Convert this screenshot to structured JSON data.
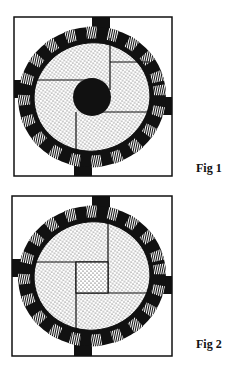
{
  "figures": [
    {
      "id": "fig1",
      "caption": "Fig 1",
      "frame": {
        "x": 14,
        "y": 17,
        "w": 158,
        "h": 159
      },
      "center": {
        "x": 92,
        "y": 97
      },
      "center_feature": "black-disc"
    },
    {
      "id": "fig2",
      "caption": "Fig 2",
      "frame": {
        "x": 12,
        "y": 196,
        "w": 160,
        "h": 160
      },
      "center": {
        "x": 92,
        "y": 276
      },
      "center_feature": "square"
    }
  ],
  "colors": {
    "ink": "#111111",
    "paper": "#ffffff"
  }
}
